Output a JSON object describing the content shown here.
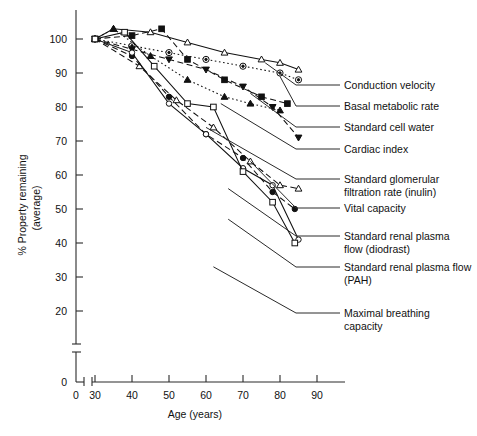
{
  "figure": {
    "caption_fragment": "",
    "background": "#ffffff",
    "ink_color": "#111111"
  },
  "axes": {
    "x": {
      "title": "Age (years)",
      "ticks": [
        0,
        30,
        40,
        50,
        60,
        70,
        80,
        90
      ],
      "break_after": 0,
      "range": [
        0,
        95
      ]
    },
    "y": {
      "title_line1": "% Property remaining",
      "title_line2": "(average)",
      "ticks": [
        0,
        20,
        30,
        40,
        50,
        60,
        70,
        80,
        90,
        100
      ],
      "break_after": 0,
      "range": [
        0,
        105
      ]
    }
  },
  "chart_data": {
    "type": "line",
    "title": "",
    "xlabel": "Age (years)",
    "ylabel": "% Property remaining (average)",
    "xlim": [
      0,
      95
    ],
    "ylim": [
      0,
      105
    ],
    "grid": false,
    "legend_position": "right-leader-lines",
    "x_ticks": [
      0,
      30,
      40,
      50,
      60,
      70,
      80,
      90
    ],
    "y_ticks": [
      0,
      20,
      30,
      40,
      50,
      60,
      70,
      80,
      90,
      100
    ],
    "series": [
      {
        "name": "Conduction velocity",
        "marker": "triangle-open",
        "line": "solid",
        "x": [
          30,
          35,
          45,
          55,
          65,
          75,
          80,
          85
        ],
        "values": [
          100,
          103,
          102,
          99,
          96,
          94,
          93,
          91
        ]
      },
      {
        "name": "Basal metabolic rate",
        "marker": "circle-target",
        "line": "dotted",
        "x": [
          30,
          40,
          50,
          60,
          70,
          80,
          85
        ],
        "values": [
          100,
          98,
          96,
          94,
          92,
          90,
          88
        ]
      },
      {
        "name": "Standard cell water",
        "marker": "square-solid",
        "line": "dashed",
        "x": [
          30,
          40,
          48,
          55,
          65,
          75,
          82
        ],
        "values": [
          100,
          101,
          103,
          94,
          88,
          83,
          81
        ]
      },
      {
        "name": "Cardiac index",
        "marker": "triangle-solid",
        "line": "dotted",
        "x": [
          30,
          35,
          45,
          55,
          65,
          72,
          80
        ],
        "values": [
          100,
          103,
          95,
          88,
          83,
          81,
          79
        ]
      },
      {
        "name": "Standard glomerular filtration rate (inulin)",
        "marker": "triangle-down-solid",
        "line": "dashed",
        "x": [
          30,
          40,
          50,
          60,
          70,
          78,
          85
        ],
        "values": [
          100,
          97,
          94,
          91,
          86,
          80,
          71
        ]
      },
      {
        "name": "Vital capacity",
        "marker": "triangle-open",
        "line": "dashed",
        "x": [
          30,
          42,
          52,
          62,
          72,
          80,
          85
        ],
        "values": [
          100,
          92,
          82,
          74,
          64,
          57,
          56
        ]
      },
      {
        "name": "Standard renal plasma flow (diodrast)",
        "marker": "circle-solid",
        "line": "dashed",
        "x": [
          30,
          40,
          50,
          60,
          70,
          78,
          84
        ],
        "values": [
          100,
          95,
          83,
          72,
          65,
          55,
          50
        ]
      },
      {
        "name": "Standard renal plasma flow (PAH)",
        "marker": "circle-open",
        "line": "solid",
        "x": [
          30,
          40,
          50,
          60,
          70,
          78,
          85
        ],
        "values": [
          100,
          96,
          81,
          72,
          62,
          57,
          41
        ]
      },
      {
        "name": "Maximal breathing capacity",
        "marker": "square-open",
        "line": "solid",
        "x": [
          30,
          38,
          46,
          55,
          62,
          70,
          78,
          84
        ],
        "values": [
          100,
          102,
          92,
          81,
          80,
          61,
          52,
          40
        ]
      }
    ]
  },
  "legend": [
    {
      "label": "Conduction velocity",
      "lines": [
        "Conduction velocity"
      ]
    },
    {
      "label": "Basal metabolic rate",
      "lines": [
        "Basal metabolic rate"
      ]
    },
    {
      "label": "Standard cell water",
      "lines": [
        "Standard cell water"
      ]
    },
    {
      "label": "Cardiac index",
      "lines": [
        "Cardiac index"
      ]
    },
    {
      "label": "Standard glomerular filtration rate (inulin)",
      "lines": [
        "Standard glomerular",
        "filtration rate (inulin)"
      ]
    },
    {
      "label": "Vital capacity",
      "lines": [
        "Vital capacity"
      ]
    },
    {
      "label": "Standard renal plasma flow (diodrast)",
      "lines": [
        "Standard renal plasma",
        "flow (diodrast)"
      ]
    },
    {
      "label": "Standard renal plasma flow (PAH)",
      "lines": [
        "Standard renal plasma flow",
        "(PAH)"
      ]
    },
    {
      "label": "Maximal breathing capacity",
      "lines": [
        "Maximal breathing",
        "capacity"
      ]
    }
  ]
}
